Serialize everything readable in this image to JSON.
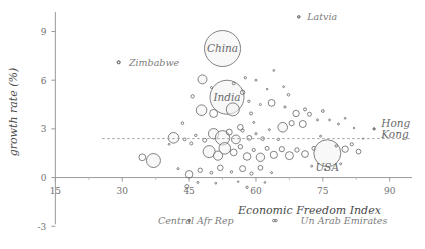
{
  "chart_data": {
    "type": "scatter",
    "title": "",
    "subtitle": "",
    "xlabel": "Economic Freedom Index",
    "ylabel": "growth rate (%)",
    "xlim": [
      12,
      95
    ],
    "ylim": [
      -3.6,
      10.2
    ],
    "xticks": [
      15,
      30,
      45,
      60,
      75,
      90
    ],
    "yticks": [
      -3,
      0,
      3,
      6,
      9
    ],
    "grid": false,
    "legend_position": "none",
    "reference_line": {
      "axis": "y",
      "value": 2.4,
      "style": "dashed",
      "label": ""
    },
    "annotations": [
      {
        "label": "Latvia",
        "x": 71.5,
        "y": 9.9,
        "marker_x": 69.6,
        "marker_y": 9.9
      },
      {
        "label": "Zimbabwe",
        "x": 31.5,
        "y": 7.1,
        "marker_x": 29.2,
        "marker_y": 7.1
      },
      {
        "label": "China",
        "x": 52.5,
        "y": 7.95,
        "marker_x": 52.5,
        "marker_y": 7.95
      },
      {
        "label": "India",
        "x": 53.5,
        "y": 4.95,
        "marker_x": 53.5,
        "marker_y": 4.95
      },
      {
        "label": "Hong Kong",
        "x": 89.0,
        "y": 2.9,
        "marker_x": 86.5,
        "marker_y": 3.0
      },
      {
        "label": "USA",
        "x": 76.0,
        "y": 0.65,
        "marker_x": 76.0,
        "marker_y": 1.5
      },
      {
        "label": "Central Afr Rep",
        "x": 38.0,
        "y": -2.65,
        "marker_x": 45.0,
        "marker_y": -2.65
      },
      {
        "label": "Un Arab Emirates",
        "x": 70.0,
        "y": -2.65,
        "marker_x": 64.0,
        "marker_y": -2.65
      }
    ],
    "bubbles": [
      {
        "x": 29.2,
        "y": 7.1,
        "r": 1.6
      },
      {
        "x": 52.5,
        "y": 7.95,
        "r": 18.0
      },
      {
        "x": 53.5,
        "y": 4.95,
        "r": 17.0
      },
      {
        "x": 69.6,
        "y": 9.9,
        "r": 1.1
      },
      {
        "x": 48.0,
        "y": 6.05,
        "r": 4.5
      },
      {
        "x": 45.8,
        "y": 5.0,
        "r": 1.7
      },
      {
        "x": 47.8,
        "y": 4.15,
        "r": 5.3
      },
      {
        "x": 50.5,
        "y": 3.95,
        "r": 4.0
      },
      {
        "x": 54.8,
        "y": 4.2,
        "r": 6.5
      },
      {
        "x": 57.0,
        "y": 5.25,
        "r": 2.2
      },
      {
        "x": 58.4,
        "y": 4.7,
        "r": 1.2
      },
      {
        "x": 58.9,
        "y": 3.95,
        "r": 1.5
      },
      {
        "x": 61.0,
        "y": 4.5,
        "r": 1.0
      },
      {
        "x": 63.5,
        "y": 4.6,
        "r": 3.4
      },
      {
        "x": 66.5,
        "y": 4.35,
        "r": 1.1
      },
      {
        "x": 67.3,
        "y": 5.1,
        "r": 1.3
      },
      {
        "x": 69.0,
        "y": 3.95,
        "r": 3.2
      },
      {
        "x": 71.0,
        "y": 4.2,
        "r": 1.5
      },
      {
        "x": 66.2,
        "y": 5.6,
        "r": 0.9
      },
      {
        "x": 62.5,
        "y": 5.45,
        "r": 0.8
      },
      {
        "x": 60.0,
        "y": 6.0,
        "r": 1.0
      },
      {
        "x": 57.6,
        "y": 6.15,
        "r": 1.2
      },
      {
        "x": 64.0,
        "y": 6.6,
        "r": 0.9
      },
      {
        "x": 66.0,
        "y": 3.1,
        "r": 4.8
      },
      {
        "x": 68.0,
        "y": 3.35,
        "r": 2.6
      },
      {
        "x": 70.5,
        "y": 3.3,
        "r": 3.5
      },
      {
        "x": 72.0,
        "y": 3.9,
        "r": 2.0
      },
      {
        "x": 73.8,
        "y": 3.55,
        "r": 1.0
      },
      {
        "x": 75.0,
        "y": 4.1,
        "r": 1.4
      },
      {
        "x": 76.5,
        "y": 3.55,
        "r": 0.9
      },
      {
        "x": 78.5,
        "y": 3.3,
        "r": 1.0
      },
      {
        "x": 80.0,
        "y": 3.65,
        "r": 0.9
      },
      {
        "x": 82.0,
        "y": 3.05,
        "r": 0.8
      },
      {
        "x": 86.5,
        "y": 3.0,
        "r": 1.0
      },
      {
        "x": 84.0,
        "y": 2.4,
        "r": 0.7
      },
      {
        "x": 41.5,
        "y": 2.45,
        "r": 5.3
      },
      {
        "x": 44.0,
        "y": 2.35,
        "r": 1.4
      },
      {
        "x": 45.5,
        "y": 2.1,
        "r": 1.5
      },
      {
        "x": 46.5,
        "y": 2.6,
        "r": 1.2
      },
      {
        "x": 48.5,
        "y": 2.3,
        "r": 2.0
      },
      {
        "x": 50.5,
        "y": 2.7,
        "r": 5.2
      },
      {
        "x": 52.5,
        "y": 2.45,
        "r": 7.2
      },
      {
        "x": 54.0,
        "y": 2.8,
        "r": 3.0
      },
      {
        "x": 55.5,
        "y": 2.35,
        "r": 4.4
      },
      {
        "x": 57.0,
        "y": 2.9,
        "r": 1.6
      },
      {
        "x": 58.5,
        "y": 2.45,
        "r": 2.4
      },
      {
        "x": 60.0,
        "y": 2.7,
        "r": 1.1
      },
      {
        "x": 61.5,
        "y": 2.4,
        "r": 1.8
      },
      {
        "x": 63.0,
        "y": 2.95,
        "r": 1.0
      },
      {
        "x": 49.5,
        "y": 1.6,
        "r": 6.0
      },
      {
        "x": 51.5,
        "y": 1.35,
        "r": 4.6
      },
      {
        "x": 53.0,
        "y": 1.8,
        "r": 5.8
      },
      {
        "x": 55.0,
        "y": 1.55,
        "r": 3.4
      },
      {
        "x": 56.5,
        "y": 1.9,
        "r": 2.2
      },
      {
        "x": 58.0,
        "y": 1.3,
        "r": 3.8
      },
      {
        "x": 59.5,
        "y": 1.7,
        "r": 1.6
      },
      {
        "x": 61.0,
        "y": 1.25,
        "r": 4.2
      },
      {
        "x": 62.5,
        "y": 1.8,
        "r": 2.0
      },
      {
        "x": 64.0,
        "y": 1.4,
        "r": 3.6
      },
      {
        "x": 65.8,
        "y": 1.75,
        "r": 2.6
      },
      {
        "x": 67.5,
        "y": 1.35,
        "r": 4.0
      },
      {
        "x": 69.2,
        "y": 1.7,
        "r": 2.2
      },
      {
        "x": 71.0,
        "y": 1.45,
        "r": 3.4
      },
      {
        "x": 73.0,
        "y": 1.8,
        "r": 2.0
      },
      {
        "x": 76.0,
        "y": 1.5,
        "r": 13.5
      },
      {
        "x": 80.0,
        "y": 1.75,
        "r": 3.2
      },
      {
        "x": 81.5,
        "y": 2.05,
        "r": 1.6
      },
      {
        "x": 83.0,
        "y": 1.6,
        "r": 2.4
      },
      {
        "x": 37.0,
        "y": 1.05,
        "r": 7.0
      },
      {
        "x": 34.5,
        "y": 1.25,
        "r": 3.4
      },
      {
        "x": 42.5,
        "y": 0.55,
        "r": 1.0
      },
      {
        "x": 45.0,
        "y": 0.2,
        "r": 3.8
      },
      {
        "x": 47.5,
        "y": 0.45,
        "r": 2.2
      },
      {
        "x": 50.0,
        "y": 0.3,
        "r": 1.4
      },
      {
        "x": 52.0,
        "y": 0.6,
        "r": 2.8
      },
      {
        "x": 54.5,
        "y": 0.35,
        "r": 1.2
      },
      {
        "x": 57.0,
        "y": 0.55,
        "r": 3.0
      },
      {
        "x": 59.0,
        "y": 0.25,
        "r": 1.6
      },
      {
        "x": 61.0,
        "y": 0.6,
        "r": 2.4
      },
      {
        "x": 63.5,
        "y": 0.3,
        "r": 1.0
      },
      {
        "x": 43.5,
        "y": 3.35,
        "r": 1.3
      },
      {
        "x": 40.5,
        "y": 2.05,
        "r": 0.9
      },
      {
        "x": 47.0,
        "y": -0.3,
        "r": 1.0
      },
      {
        "x": 51.0,
        "y": -0.35,
        "r": 0.9
      },
      {
        "x": 56.0,
        "y": -0.25,
        "r": 0.8
      },
      {
        "x": 62.0,
        "y": -0.3,
        "r": 0.9
      },
      {
        "x": 44.5,
        "y": -0.55,
        "r": 2.0
      },
      {
        "x": 58.0,
        "y": -0.6,
        "r": 1.2
      },
      {
        "x": 64.5,
        "y": -2.65,
        "r": 1.2
      },
      {
        "x": 45.0,
        "y": -2.65,
        "r": 0.9
      },
      {
        "x": 55.0,
        "y": 5.8,
        "r": 1.4
      },
      {
        "x": 50.0,
        "y": 5.55,
        "r": 1.0
      },
      {
        "x": 56.5,
        "y": 3.1,
        "r": 2.8
      },
      {
        "x": 59.5,
        "y": 3.4,
        "r": 1.0
      },
      {
        "x": 65.0,
        "y": 2.35,
        "r": 1.2
      },
      {
        "x": 74.5,
        "y": 2.55,
        "r": 1.0
      },
      {
        "x": 78.0,
        "y": 1.95,
        "r": 1.2
      },
      {
        "x": 72.5,
        "y": 0.7,
        "r": 1.0
      },
      {
        "x": 75.5,
        "y": 0.5,
        "r": 0.8
      },
      {
        "x": 79.0,
        "y": 0.85,
        "r": 1.0
      }
    ]
  }
}
